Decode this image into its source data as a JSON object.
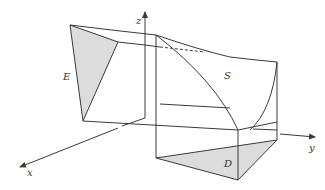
{
  "figure": {
    "colors": {
      "line": "#3a3a3a",
      "shade": "#dcdcdc",
      "background": "#ffffff"
    },
    "axes": {
      "x": "x",
      "y": "y",
      "z": "z"
    },
    "labels": {
      "E": "E",
      "S": "S",
      "D": "D"
    }
  }
}
